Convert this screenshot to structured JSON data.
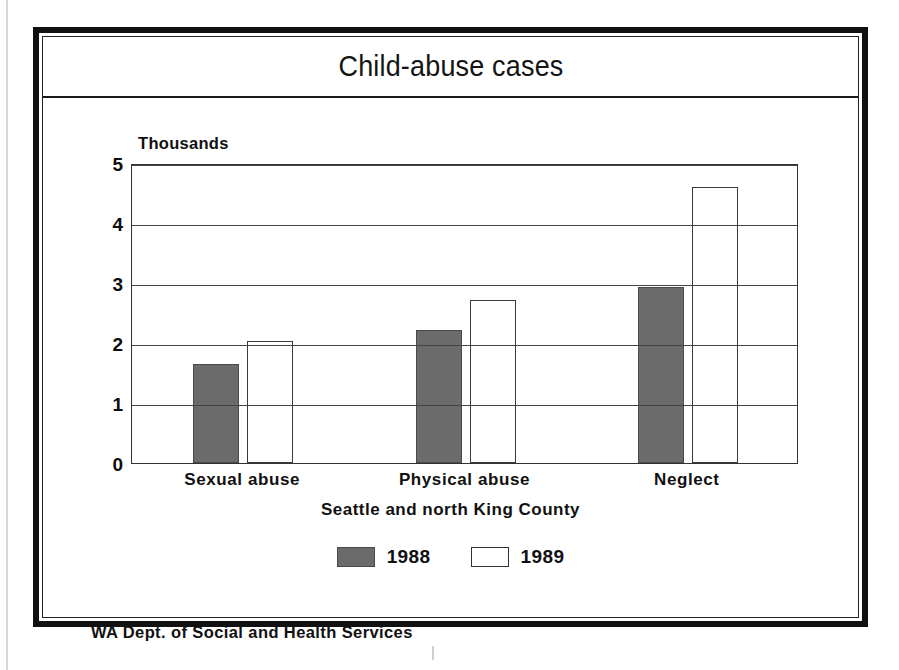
{
  "chart_data": {
    "type": "bar",
    "title": "Child-abuse cases",
    "xlabel": "Seattle and north King County",
    "ylabel": "Thousands",
    "categories": [
      "Sexual abuse",
      "Physical abuse",
      "Neglect"
    ],
    "series": [
      {
        "name": "1988",
        "values": [
          1.65,
          2.22,
          2.94
        ],
        "color": "#6b6b6b"
      },
      {
        "name": "1989",
        "values": [
          2.03,
          2.72,
          4.6
        ],
        "color": "#ffffff"
      }
    ],
    "ylim": [
      0,
      5
    ],
    "yticks": [
      "0",
      "1",
      "2",
      "3",
      "4",
      "5"
    ],
    "grid": true,
    "legend_position": "bottom",
    "source": "WA Dept. of Social and Health Services"
  },
  "frame": {
    "title": "Child-abuse cases",
    "unit_label": "Thousands",
    "axis_caption": "Seattle and north King County",
    "source": "WA Dept. of Social and Health Services"
  },
  "legend": {
    "items": [
      {
        "label": "1988",
        "swatch": "filled-gray-swatch"
      },
      {
        "label": "1989",
        "swatch": "outlined-white-swatch"
      }
    ]
  }
}
